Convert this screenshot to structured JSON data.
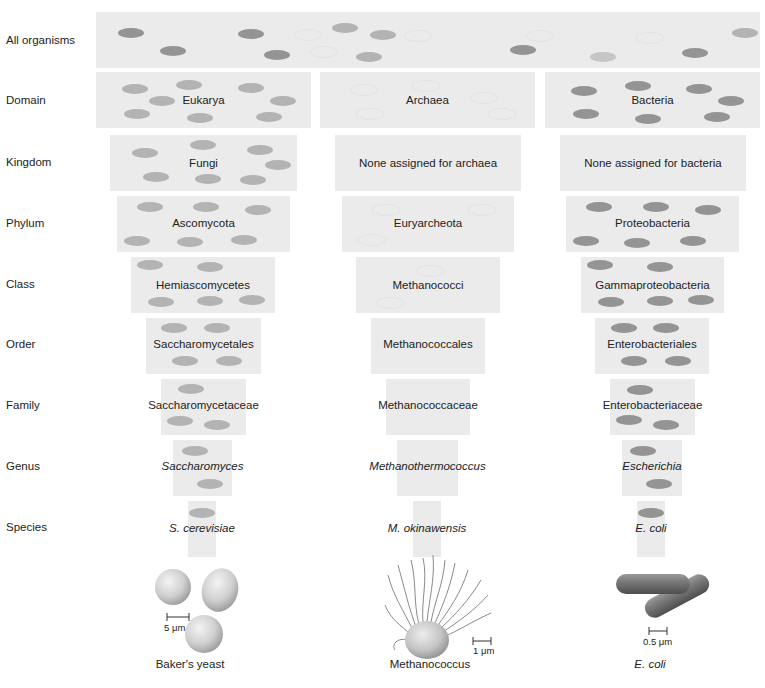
{
  "ranks": [
    "All organisms",
    "Domain",
    "Kingdom",
    "Phylum",
    "Class",
    "Order",
    "Family",
    "Genus",
    "Species"
  ],
  "top": {
    "label": ""
  },
  "columns": [
    {
      "name": "eukarya",
      "levels": [
        {
          "rank": "Domain",
          "label": "Eukarya",
          "italic": false
        },
        {
          "rank": "Kingdom",
          "label": "Fungi",
          "italic": false
        },
        {
          "rank": "Phylum",
          "label": "Ascomycota",
          "italic": false
        },
        {
          "rank": "Class",
          "label": "Hemiascomycetes",
          "italic": false
        },
        {
          "rank": "Order",
          "label": "Saccharomycetales",
          "italic": false
        },
        {
          "rank": "Family",
          "label": "Saccharomycetaceae",
          "italic": false
        },
        {
          "rank": "Genus",
          "label": "Saccharomyces",
          "italic": true
        },
        {
          "rank": "Species",
          "label": "S. cerevisiae",
          "italic": true
        }
      ],
      "illustration": {
        "icon": "yeast-cells-icon",
        "scale": "5 μm",
        "caption": "Baker's yeast",
        "caption_italic": false
      }
    },
    {
      "name": "archaea",
      "levels": [
        {
          "rank": "Domain",
          "label": "Archaea",
          "italic": false
        },
        {
          "rank": "Kingdom",
          "label": "None assigned for archaea",
          "italic": false
        },
        {
          "rank": "Phylum",
          "label": "Euryarcheota",
          "italic": false
        },
        {
          "rank": "Class",
          "label": "Methanococci",
          "italic": false
        },
        {
          "rank": "Order",
          "label": "Methanococcales",
          "italic": false
        },
        {
          "rank": "Family",
          "label": "Methanococcaceae",
          "italic": false
        },
        {
          "rank": "Genus",
          "label": "Methanothermococcus",
          "italic": true
        },
        {
          "rank": "Species",
          "label": "M. okinawensis",
          "italic": true
        }
      ],
      "illustration": {
        "icon": "methanococcus-cell-icon",
        "scale": "1 μm",
        "caption": "Methanococcus",
        "caption_italic": false
      }
    },
    {
      "name": "bacteria",
      "levels": [
        {
          "rank": "Domain",
          "label": "Bacteria",
          "italic": false
        },
        {
          "rank": "Kingdom",
          "label": "None assigned for bacteria",
          "italic": false
        },
        {
          "rank": "Phylum",
          "label": "Proteobacteria",
          "italic": false
        },
        {
          "rank": "Class",
          "label": "Gammaproteobacteria",
          "italic": false
        },
        {
          "rank": "Order",
          "label": "Enterobacteriales",
          "italic": false
        },
        {
          "rank": "Family",
          "label": "Enterobacteriaceae",
          "italic": false
        },
        {
          "rank": "Genus",
          "label": "Escherichia",
          "italic": true
        },
        {
          "rank": "Species",
          "label": "E. coli",
          "italic": true
        }
      ],
      "illustration": {
        "icon": "ecoli-rods-icon",
        "scale": "0.5 μm",
        "caption": "E. coli",
        "caption_italic": true
      }
    }
  ],
  "colors": {
    "box_bg": "#ebebeb",
    "eukarya_cell": "#b3b3b3",
    "bacteria_cell": "#949494",
    "archaea_cell_outline": "#e2e2e2"
  }
}
